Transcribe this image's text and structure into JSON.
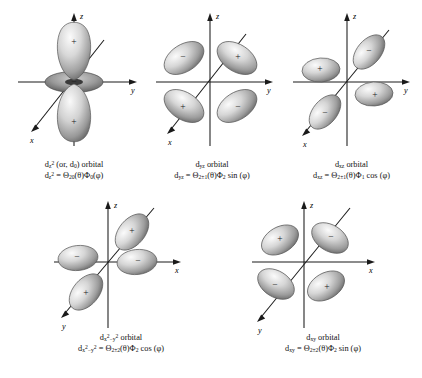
{
  "figure": {
    "background": "#ffffff",
    "ink": "#1a1a1a",
    "lobe_light": "#f2f2f2",
    "lobe_mid": "#b8b8b8",
    "lobe_dark": "#6e6e6e"
  },
  "orbitals": [
    {
      "id": "dz2",
      "name_line": "orbital",
      "symbol_html": "d<sub>z</sub><sup>2</sup> (or, d<sub>0</sub>)",
      "formula_html": "d<sub>z</sub><sup>2</sup> = Θ<sub>20</sub>(θ)Φ<sub>0</sub>(φ)",
      "axes": [
        {
          "label": "z",
          "dir": "up"
        },
        {
          "label": "y",
          "dir": "right"
        },
        {
          "label": "x",
          "dir": "down-left"
        }
      ],
      "lobes": [
        {
          "position": "up",
          "sign": "+"
        },
        {
          "position": "down",
          "sign": "+"
        },
        {
          "position": "torus",
          "sign": "−"
        }
      ]
    },
    {
      "id": "dyz",
      "name_line": "orbital",
      "symbol_html": "d<sub>yz</sub>",
      "formula_html": "d<sub>yz</sub> = Θ<sub>2±1</sub>(θ)Φ<sub>2</sub> sin (φ)",
      "axes": [
        {
          "label": "z",
          "dir": "up"
        },
        {
          "label": "y",
          "dir": "right"
        },
        {
          "label": "x",
          "dir": "down-left"
        }
      ],
      "lobes": [
        {
          "position": "upper-left",
          "sign": "−"
        },
        {
          "position": "upper-right",
          "sign": "+"
        },
        {
          "position": "lower-left",
          "sign": "+"
        },
        {
          "position": "lower-right",
          "sign": "−"
        }
      ]
    },
    {
      "id": "dxz",
      "name_line": "orbital",
      "symbol_html": "d<sub>xz</sub>",
      "formula_html": "d<sub>xz</sub> = Θ<sub>2±1</sub>(θ)Φ<sub>1</sub> cos (φ)",
      "axes": [
        {
          "label": "z",
          "dir": "up"
        },
        {
          "label": "y",
          "dir": "right"
        },
        {
          "label": "x",
          "dir": "down-left"
        }
      ],
      "lobes": [
        {
          "position": "upper-right-diagonal",
          "sign": "−"
        },
        {
          "position": "left",
          "sign": "+"
        },
        {
          "position": "lower-left-diagonal",
          "sign": "−"
        },
        {
          "position": "right",
          "sign": "+"
        }
      ]
    },
    {
      "id": "dx2-y2",
      "name_line": "orbital",
      "symbol_html": "d<sub>x</sub><sup>2</sup><sub>−</sub><sub>y</sub><sup>2</sup>",
      "formula_html": "d<sub>x</sub><sup>2</sup><sub>−</sub><sub>y</sub><sup>2</sup> = Θ<sub>2±2</sub>(θ)Φ<sub>2</sub> cos (φ)",
      "axes": [
        {
          "label": "z",
          "dir": "up"
        },
        {
          "label": "x",
          "dir": "right"
        },
        {
          "label": "y",
          "dir": "down-left"
        }
      ],
      "lobes": [
        {
          "position": "upper-right-diagonal",
          "sign": "+"
        },
        {
          "position": "left",
          "sign": "−"
        },
        {
          "position": "right",
          "sign": "−"
        },
        {
          "position": "lower-left-diagonal",
          "sign": "+"
        }
      ]
    },
    {
      "id": "dxy",
      "name_line": "orbital",
      "symbol_html": "d<sub>xy</sub>",
      "formula_html": "d<sub>xy</sub> = Θ<sub>2±2</sub>(θ)Φ<sub>2</sub> sin (φ)",
      "axes": [
        {
          "label": "z",
          "dir": "up"
        },
        {
          "label": "x",
          "dir": "right"
        },
        {
          "label": "y",
          "dir": "down-left"
        }
      ],
      "lobes": [
        {
          "position": "upper-left",
          "sign": "+"
        },
        {
          "position": "upper-right",
          "sign": "−"
        },
        {
          "position": "lower-left",
          "sign": "−"
        },
        {
          "position": "lower-right",
          "sign": "+"
        }
      ]
    }
  ]
}
